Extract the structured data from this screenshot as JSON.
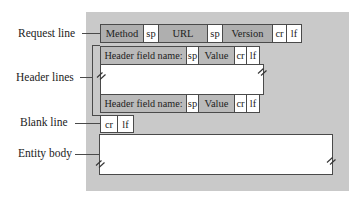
{
  "figure": {
    "type": "message-format-diagram"
  },
  "colors": {
    "panel_bg": "#c9c9c9",
    "request_box_bg": "#afafaf",
    "header_box_bg": "#bababa",
    "white_box_bg": "#ffffff",
    "border": "#4a4a4a",
    "text": "#222222"
  },
  "side_labels": [
    {
      "label": "Request line"
    },
    {
      "label": "Header lines"
    },
    {
      "label": "Blank line"
    },
    {
      "label": "Entity body"
    }
  ],
  "request_line": {
    "cells": [
      {
        "text": "Method"
      },
      {
        "text": "sp"
      },
      {
        "text": "URL"
      },
      {
        "text": "sp"
      },
      {
        "text": "Version"
      },
      {
        "text": "cr"
      },
      {
        "text": "lf"
      }
    ]
  },
  "header_line": {
    "cells": [
      {
        "text": "Header field name:"
      },
      {
        "text": "sp"
      },
      {
        "text": "Value"
      },
      {
        "text": "cr"
      },
      {
        "text": "lf"
      }
    ]
  },
  "blank_line": {
    "cells": [
      {
        "text": "cr"
      },
      {
        "text": "lf"
      }
    ]
  },
  "icons": {
    "break_mark": "double-slash-continuation"
  }
}
